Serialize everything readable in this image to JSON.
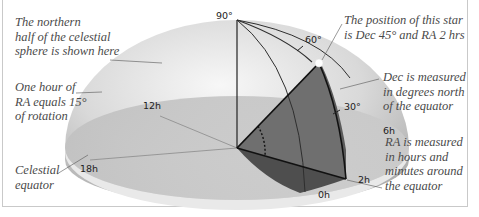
{
  "diagram": {
    "captions": {
      "northern_half": "The northern\nhalf of the celestial\nsphere is shown here",
      "ra_hour": "One hour of\nRA equals 15°\nof rotation",
      "celestial_equator": "Celestial\nequator",
      "star_position": "The position of this star\nis Dec 45° and RA 2 hrs",
      "dec_measured": "Dec is measured\nin degrees north\nof the equator",
      "ra_measured": "RA is measured\nin hours and\nminutes around\nthe equator"
    },
    "dec_labels": {
      "d90": "90°",
      "d60": "60°",
      "d30": "30°"
    },
    "ra_labels": {
      "h12": "12h",
      "h18": "18h",
      "h6": "6h",
      "h2": "2h",
      "h0": "0h"
    },
    "star": {
      "dec": "45°",
      "ra": "2 hrs"
    },
    "colors": {
      "dome_light": "#f2f2f2",
      "dome_dark": "#b4b4b4",
      "disc": "#c8c8c8",
      "wedge": "#6f6f6f",
      "wedge_shadow": "#4e4e4e",
      "line": "#222222",
      "caption": "#4a4a4a",
      "frame": "#c9c9c9"
    }
  }
}
